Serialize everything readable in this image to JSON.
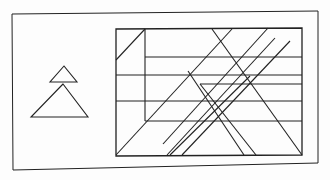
{
  "figure": {
    "type": "embedded-figures-puzzle",
    "description": "Simple figure (two stacked triangles) on the left; complex line figure on the right containing the hidden shape",
    "colors": {
      "stroke": "#222222",
      "background": "#fdfdfd"
    },
    "outer_frame": {
      "x1": 12,
      "y1": 13,
      "x2": 318,
      "y2": 24,
      "corners": [
        [
          12,
          14
        ],
        [
          318,
          11
        ],
        [
          318,
          163
        ],
        [
          13,
          170
        ]
      ]
    },
    "simple_figure": {
      "label": "target-shape",
      "small_triangle": [
        [
          64,
          66
        ],
        [
          50,
          82
        ],
        [
          77,
          82
        ]
      ],
      "large_triangle": [
        [
          63,
          84
        ],
        [
          31,
          117
        ],
        [
          88,
          117
        ]
      ]
    },
    "complex_figure": {
      "frame": [
        [
          116,
          29
        ],
        [
          302,
          28
        ],
        [
          302,
          155
        ],
        [
          116,
          156
        ]
      ],
      "lines": [
        [
          [
            145,
            29
          ],
          [
            145,
            121
          ]
        ],
        [
          [
            116,
            60
          ],
          [
            145,
            29
          ]
        ],
        [
          [
            145,
            57
          ],
          [
            302,
            57
          ]
        ],
        [
          [
            116,
            75
          ],
          [
            302,
            75
          ]
        ],
        [
          [
            200,
            84
          ],
          [
            302,
            84
          ]
        ],
        [
          [
            116,
            101
          ],
          [
            302,
            101
          ]
        ],
        [
          [
            145,
            121
          ],
          [
            302,
            121
          ]
        ],
        [
          [
            116,
            155
          ],
          [
            232,
            29
          ]
        ],
        [
          [
            167,
            155
          ],
          [
            275,
            38
          ]
        ],
        [
          [
            182,
            155
          ],
          [
            290,
            41
          ]
        ],
        [
          [
            212,
            29
          ],
          [
            302,
            155
          ]
        ],
        [
          [
            170,
            155
          ],
          [
            250,
            76
          ]
        ],
        [
          [
            268,
            28
          ],
          [
            163,
            144
          ]
        ],
        [
          [
            188,
            71
          ],
          [
            244,
            155
          ]
        ],
        [
          [
            200,
            84
          ],
          [
            256,
            155
          ]
        ]
      ]
    }
  }
}
